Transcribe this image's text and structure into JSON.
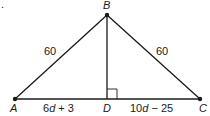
{
  "diagram": {
    "type": "geometry-triangle",
    "marker": ".",
    "points": {
      "A": {
        "label": "A",
        "x": 15,
        "y": 99
      },
      "B": {
        "label": "B",
        "x": 107,
        "y": 15
      },
      "C": {
        "label": "C",
        "x": 200,
        "y": 99
      },
      "D": {
        "label": "D",
        "x": 107,
        "y": 99
      }
    },
    "segments": [
      {
        "from": "A",
        "to": "B",
        "label": "60"
      },
      {
        "from": "B",
        "to": "C",
        "label": "60"
      },
      {
        "from": "A",
        "to": "D",
        "label_coef": "6",
        "label_var": "d",
        "label_rest": " + 3"
      },
      {
        "from": "D",
        "to": "C",
        "label_coef": "10",
        "label_var": "d",
        "label_rest": " − 25"
      },
      {
        "from": "B",
        "to": "D",
        "label": ""
      }
    ],
    "right_angle_at": "D",
    "colors": {
      "line": "#1a1a1a",
      "background": "#ffffff"
    }
  }
}
